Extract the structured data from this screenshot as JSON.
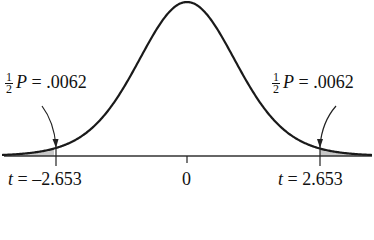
{
  "chart_data": {
    "type": "area",
    "title": "",
    "xlabel": "",
    "ylabel": "",
    "x_ticks": [
      {
        "value": -2.653,
        "label": "t = −2.653"
      },
      {
        "value": 0,
        "label": "0"
      },
      {
        "value": 2.653,
        "label": "t = 2.653"
      }
    ],
    "shaded_regions": [
      {
        "from": "-inf",
        "to": -2.653,
        "area": 0.0062,
        "label": "½ P = .0062"
      },
      {
        "from": 2.653,
        "to": "inf",
        "area": 0.0062,
        "label": "½ P = .0062"
      }
    ],
    "total_two_sided_p": 0.0124,
    "grid": false,
    "legend": null
  },
  "labels": {
    "left_annotation": {
      "frac_num": "1",
      "frac_den": "2",
      "symbol": "P",
      "equals": " = .0062"
    },
    "right_annotation": {
      "frac_num": "1",
      "frac_den": "2",
      "symbol": "P",
      "equals": " = .0062"
    },
    "tick_left": {
      "var": "t",
      "value": " = –2.653"
    },
    "tick_center": "0",
    "tick_right": {
      "var": "t",
      "value": " = 2.653"
    }
  },
  "colors": {
    "curve": "#1a1a1a",
    "axis": "#333333",
    "shade": "#c8c8c8",
    "text": "#111111"
  }
}
